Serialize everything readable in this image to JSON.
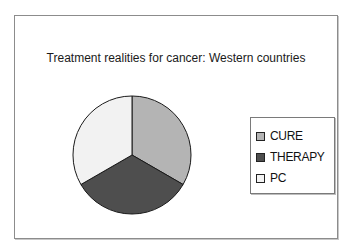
{
  "chart_data": {
    "type": "pie",
    "title": "Treatment realities for cancer: Western countries",
    "categories": [
      "CURE",
      "THERAPY",
      "PC"
    ],
    "values": [
      33.3,
      33.3,
      33.3
    ],
    "colors": [
      "#b4b4b4",
      "#4e4e4e",
      "#f2f2f2"
    ],
    "start_angle_deg": 0,
    "direction": "clockwise",
    "legend_position": "right",
    "data_labels": false
  },
  "legend": {
    "items": [
      {
        "label": "CURE",
        "color": "#b4b4b4"
      },
      {
        "label": "THERAPY",
        "color": "#4e4e4e"
      },
      {
        "label": "PC",
        "color": "#f2f2f2"
      }
    ]
  }
}
